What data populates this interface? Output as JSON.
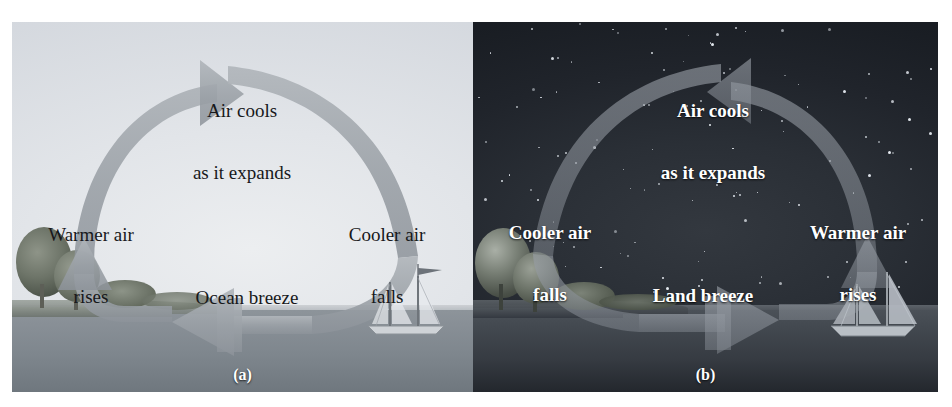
{
  "figure": {
    "caption_a": "(a)",
    "caption_b": "(b)",
    "colors": {
      "day_sky": "#e4e7ea",
      "day_water": "#7e868d",
      "night_sky": "#262b32",
      "night_water": "#3b4048",
      "arrow_day": "#9aa0a6",
      "arrow_night": "#8e949c",
      "text_day": "#17181a",
      "text_night": "#ffffff"
    }
  },
  "panel_day": {
    "name": "(a)",
    "scene": "daytime-coastal-scene",
    "circulation": "clockwise",
    "labels": {
      "left": "Warmer air\nrises",
      "top": "Air cools\nas it expands",
      "right": "Cooler air\nfalls",
      "bottom": "Ocean breeze"
    },
    "left_line1": "Warmer air",
    "left_line2": "rises",
    "top_line1": "Air cools",
    "top_line2": "as it expands",
    "right_line1": "Cooler air",
    "right_line2": "falls",
    "bottom_line1": "Ocean breeze",
    "objects": [
      "trees",
      "shoreline",
      "water",
      "sailboat"
    ]
  },
  "panel_night": {
    "name": "(b)",
    "scene": "nighttime-coastal-scene",
    "circulation": "counter-clockwise",
    "labels": {
      "left": "Cooler air\nfalls",
      "top": "Air cools\nas it expands",
      "right": "Warmer air\nrises",
      "bottom": "Land breeze"
    },
    "left_line1": "Cooler air",
    "left_line2": "falls",
    "top_line1": "Air cools",
    "top_line2": "as it expands",
    "right_line1": "Warmer air",
    "right_line2": "rises",
    "bottom_line1": "Land breeze",
    "objects": [
      "stars",
      "trees",
      "shoreline",
      "water",
      "sailboat"
    ]
  }
}
